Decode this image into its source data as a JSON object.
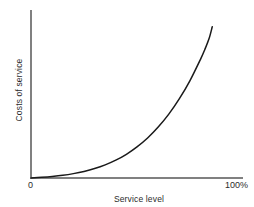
{
  "chart_data": {
    "type": "line",
    "title": "",
    "xlabel": "Service level",
    "ylabel": "Costs of service",
    "xlim": [
      0,
      100
    ],
    "ylim": [
      0,
      100
    ],
    "grid": false,
    "legend": null,
    "xtick_labels": [
      "0",
      "100%"
    ],
    "ytick_labels": [],
    "series": [
      {
        "name": "Costs of service",
        "color": "#1a1a1a",
        "x": [
          0,
          5,
          10,
          15,
          20,
          25,
          30,
          35,
          40,
          45,
          50,
          55,
          60,
          65,
          70,
          75,
          80,
          82,
          84,
          85.5
        ],
        "y": [
          0,
          0.4,
          0.9,
          1.6,
          2.6,
          3.9,
          5.6,
          7.8,
          10.6,
          14.1,
          18.5,
          23.8,
          30.3,
          38.0,
          47.2,
          58.0,
          70.8,
          76.5,
          83.0,
          90.0
        ]
      }
    ],
    "annotations": []
  },
  "axes": {
    "axis_color": "#808080",
    "axis_width_px": 2,
    "origin_label": "0",
    "x_max_label": "100%",
    "x_axis_title": "Service level",
    "y_axis_title": "Costs of service"
  },
  "curve_path": "M31,178 C70,177.4 96,172 120,159.5 C143,147.5 163,132 180,116.5 C192,105 201,88 206.5,68 C209.5,56 211,41 212,27",
  "colors": {
    "background": "#ffffff",
    "curve": "#1a1a1a",
    "axis": "#808080",
    "text": "#2b2b2b"
  }
}
